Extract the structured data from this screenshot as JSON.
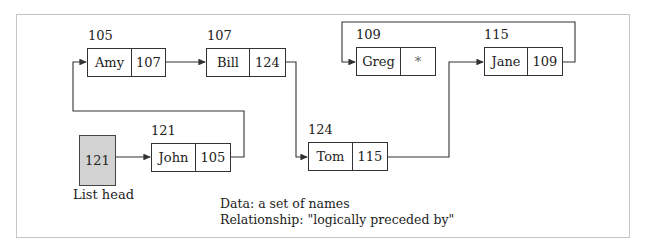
{
  "diagram": {
    "type": "linked-list",
    "list_head": {
      "label": "List head",
      "value": "121"
    },
    "nodes": [
      {
        "address": "105",
        "name": "Amy",
        "next": "107"
      },
      {
        "address": "107",
        "name": "Bill",
        "next": "124"
      },
      {
        "address": "109",
        "name": "Greg",
        "next": "*"
      },
      {
        "address": "115",
        "name": "Jane",
        "next": "109"
      },
      {
        "address": "121",
        "name": "John",
        "next": "105"
      },
      {
        "address": "124",
        "name": "Tom",
        "next": "115"
      }
    ],
    "caption": {
      "data_line": "Data:  a set of names",
      "relationship_line": "Relationship:  \"logically preceded by\""
    },
    "colors": {
      "line": "#333333",
      "head_fill": "#d2d2d2",
      "frame": "#c4c4c4"
    }
  }
}
